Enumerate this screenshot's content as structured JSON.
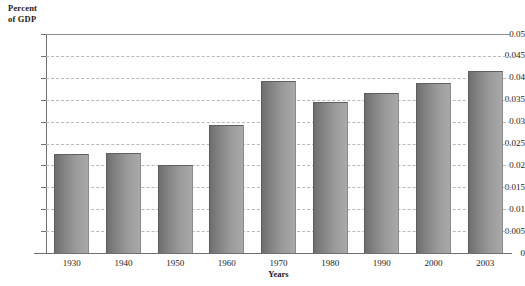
{
  "chart_data": {
    "type": "bar",
    "title": "",
    "xlabel": "Years",
    "ylabel": "Percent\nof GDP",
    "categories": [
      "1930",
      "1940",
      "1950",
      "1960",
      "1970",
      "1980",
      "1990",
      "2000",
      "2003"
    ],
    "values": [
      0.0225,
      0.0229,
      0.02,
      0.0293,
      0.0393,
      0.0345,
      0.0365,
      0.0388,
      0.0415
    ],
    "ylim": [
      0,
      0.05
    ],
    "yticks": [
      "0",
      "0.005",
      "0.01",
      "0.015",
      "0.02",
      "0.025",
      "0.03",
      "0.035",
      "0.04",
      "0.045",
      "0.05"
    ],
    "ytick_values": [
      0,
      0.005,
      0.01,
      0.015,
      0.02,
      0.025,
      0.03,
      0.035,
      0.04,
      0.045,
      0.05
    ],
    "grid": true,
    "grid_style": "dashed-horizontal",
    "legend": "none",
    "bar_color": "#8c8c8c",
    "bar_edge_color": "#5c5c5c",
    "grid_color": "#b9b9b9",
    "axis_color": "#6f6f6f",
    "background_color": "#fefefe"
  }
}
